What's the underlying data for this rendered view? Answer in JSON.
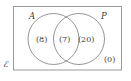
{
  "figure": {
    "type": "venn-diagram",
    "universe": {
      "symbol": "ℰ",
      "name": "universal-set"
    },
    "sets": [
      {
        "id": "A",
        "label": "A",
        "position": "left"
      },
      {
        "id": "P",
        "label": "P",
        "position": "right"
      }
    ],
    "regions": [
      {
        "id": "a-only",
        "label": "(8)",
        "value": 8,
        "description": "A only"
      },
      {
        "id": "both",
        "label": "(7)",
        "value": 7,
        "description": "A and P"
      },
      {
        "id": "p-only",
        "label": "(20)",
        "value": 20,
        "description": "P only"
      },
      {
        "id": "outside",
        "label": "(0)",
        "value": 0,
        "description": "Neither A nor P"
      }
    ],
    "colors": {
      "stroke": "#8a8a8a",
      "rect_stroke": "#9a9a9a",
      "text": "#3a3a3a",
      "background": "#ffffff"
    }
  }
}
